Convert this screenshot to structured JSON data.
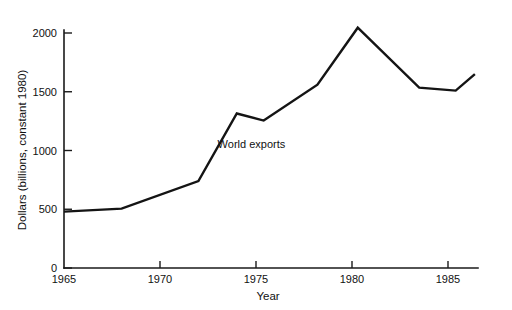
{
  "chart_data": {
    "type": "line",
    "title": "",
    "subtitle": "",
    "xlabel": "Year",
    "ylabel": "Dollars (billions, constant 1980)",
    "xlim": [
      1965,
      1986.5
    ],
    "ylim": [
      0,
      2150
    ],
    "grid": false,
    "legend": "none",
    "x_ticks": [
      1965,
      1970,
      1975,
      1980,
      1985
    ],
    "x_tick_labels": [
      "1965",
      "1970",
      "1975",
      "1980",
      "1985"
    ],
    "y_ticks": [
      0,
      500,
      1000,
      1500,
      2000
    ],
    "y_tick_labels": [
      "0",
      "500",
      "1000",
      "1500",
      "2000"
    ],
    "annotations": [
      {
        "text": "World exports",
        "x": 1973.0,
        "y": 1020
      }
    ],
    "series": [
      {
        "name": "World exports",
        "color": "#141414",
        "x": [
          1965,
          1968,
          1972,
          1974,
          1975.4,
          1978.2,
          1980.3,
          1983.5,
          1985.4,
          1986.4
        ],
        "values": [
          480,
          505,
          740,
          1315,
          1255,
          1560,
          2045,
          1535,
          1510,
          1650
        ]
      }
    ]
  },
  "colors": {
    "line": "#141414",
    "axis": "#1a1a1a",
    "text": "#111111",
    "background": "#ffffff"
  }
}
